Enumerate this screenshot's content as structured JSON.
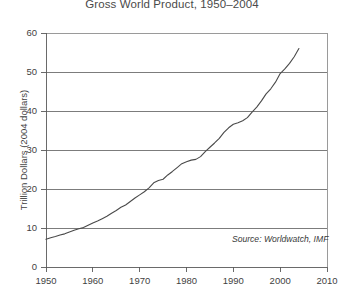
{
  "chart_data": {
    "type": "line",
    "title": "Gross World Product, 1950–2004",
    "xlabel": "",
    "ylabel": "Trillion Dollars (2004 dollars)",
    "xlim": [
      1950,
      2010
    ],
    "ylim": [
      0,
      60
    ],
    "xticks": [
      1950,
      1960,
      1970,
      1980,
      1990,
      2000,
      2010
    ],
    "xtick_labels": [
      "1950",
      "1960",
      "1970",
      "1980",
      "1990",
      "2000",
      "2010"
    ],
    "yticks": [
      0,
      10,
      20,
      30,
      40,
      50,
      60
    ],
    "ytick_labels": [
      "0",
      "10",
      "20",
      "30",
      "40",
      "50",
      "60"
    ],
    "grid": "horizontal",
    "legend": "none",
    "annotations": [
      {
        "name": "source-note",
        "text": "Source: Worldwatch, IMF",
        "x": 2000,
        "y": 6.5,
        "style": "italic"
      }
    ],
    "series": [
      {
        "name": "Gross World Product",
        "color": "#4a4a4a",
        "x": [
          1950,
          1951,
          1952,
          1953,
          1954,
          1955,
          1956,
          1957,
          1958,
          1959,
          1960,
          1961,
          1962,
          1963,
          1964,
          1965,
          1966,
          1967,
          1968,
          1969,
          1970,
          1971,
          1972,
          1973,
          1974,
          1975,
          1976,
          1977,
          1978,
          1979,
          1980,
          1981,
          1982,
          1983,
          1984,
          1985,
          1986,
          1987,
          1988,
          1989,
          1990,
          1991,
          1992,
          1993,
          1994,
          1995,
          1996,
          1997,
          1998,
          1999,
          2000,
          2001,
          2002,
          2003,
          2004
        ],
        "values": [
          7.1,
          7.5,
          7.8,
          8.2,
          8.5,
          9.0,
          9.4,
          9.8,
          10.1,
          10.7,
          11.3,
          11.8,
          12.4,
          13.0,
          13.8,
          14.5,
          15.3,
          15.9,
          16.8,
          17.7,
          18.5,
          19.3,
          20.3,
          21.6,
          22.2,
          22.5,
          23.6,
          24.5,
          25.5,
          26.5,
          27.0,
          27.4,
          27.6,
          28.3,
          29.6,
          30.7,
          31.8,
          33.0,
          34.5,
          35.7,
          36.6,
          37.0,
          37.5,
          38.3,
          39.7,
          41.0,
          42.6,
          44.4,
          45.7,
          47.4,
          49.6,
          50.8,
          52.2,
          53.9,
          56.0
        ]
      }
    ]
  }
}
